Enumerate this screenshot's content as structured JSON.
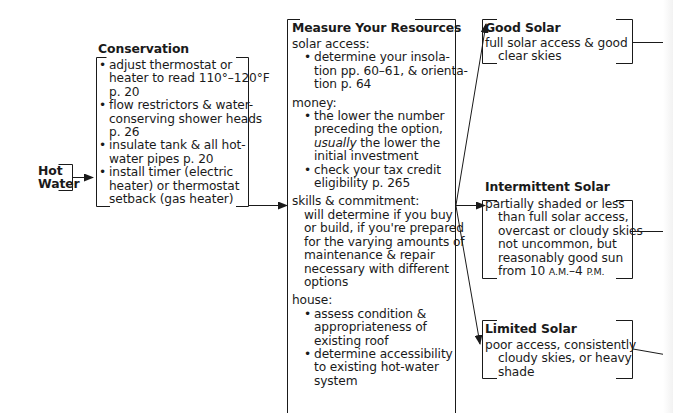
{
  "start": {
    "line1": "Hot",
    "line2": "Water"
  },
  "conservation": {
    "title": "Conservation",
    "items": [
      [
        "adjust thermostat or",
        "heater to read 110°–120°F",
        "p. 20"
      ],
      [
        "flow restrictors & water-",
        "conserving shower heads",
        "p. 26"
      ],
      [
        "insulate tank & all hot-",
        "water pipes p. 20"
      ],
      [
        "install timer (electric",
        "heater) or thermostat",
        "setback (gas heater)"
      ]
    ]
  },
  "measure": {
    "title": "Measure Your Resources",
    "solar_access": {
      "label": "solar access:",
      "items": [
        [
          "determine your insola-",
          "tion pp. 60–61, & orienta-",
          "tion p. 64"
        ]
      ]
    },
    "money": {
      "label": "money:",
      "items": [
        [
          "the lower the number",
          "preceding the option,",
          "usually",
          " the lower the",
          "initial investment"
        ],
        [
          "check your tax credit",
          "eligibility p. 265"
        ]
      ]
    },
    "skills": {
      "label": "skills & commitment:",
      "lines": [
        "will determine if you buy",
        "or build, if you're prepared",
        "for the varying amounts of",
        "maintenance & repair",
        "necessary with different",
        "options"
      ]
    },
    "house": {
      "label": "house:",
      "items": [
        [
          "assess condition &",
          "appropriateness of",
          "existing roof"
        ],
        [
          "determine accessibility",
          "to existing hot-water",
          "system"
        ]
      ]
    }
  },
  "good_solar": {
    "title": "Good Solar",
    "lines": [
      "full solar access & good",
      "clear skies"
    ]
  },
  "intermittent_solar": {
    "title": "Intermittent Solar",
    "lines": [
      "partially shaded or less",
      "than full solar access,",
      "overcast or cloudy skies",
      "not uncommon, but",
      "reasonably good sun"
    ],
    "last_prefix": "from 10 ",
    "am": "A.M.",
    "dash": "–4 ",
    "pm": "P.M."
  },
  "limited_solar": {
    "title": "Limited Solar",
    "lines": [
      "poor access, consistently",
      "cloudy skies, or heavy",
      "shade"
    ]
  }
}
